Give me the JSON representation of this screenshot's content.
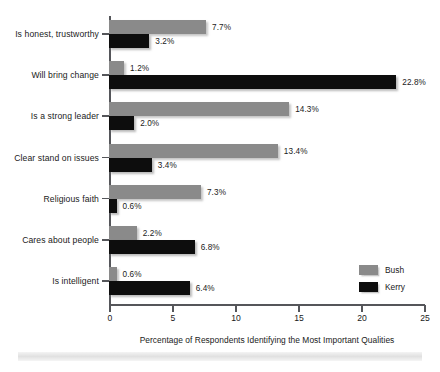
{
  "chart_data": {
    "type": "bar",
    "orientation": "horizontal",
    "title": "",
    "xlabel": "Percentage of Respondents Identifying the Most Important Qualities",
    "ylabel": "",
    "xlim": [
      0,
      25
    ],
    "xticks": [
      0,
      5,
      10,
      15,
      20,
      25
    ],
    "xtick_labels": [
      "0",
      "5",
      "10",
      "15",
      "20",
      "25"
    ],
    "grid": false,
    "legend_position": "right-bottom-inside",
    "categories": [
      "Is honest, trustworthy",
      "Will bring change",
      "Is a strong leader",
      "Clear stand on issues",
      "Religious faith",
      "Cares about people",
      "Is intelligent"
    ],
    "series": [
      {
        "name": "Bush",
        "color": "#8a8a8a",
        "values": [
          7.7,
          1.2,
          14.3,
          13.4,
          7.3,
          2.2,
          0.6
        ],
        "value_labels": [
          "7.7%",
          "1.2%",
          "14.3%",
          "13.4%",
          "7.3%",
          "2.2%",
          "0.6%"
        ]
      },
      {
        "name": "Kerry",
        "color": "#0d0d0d",
        "values": [
          3.2,
          22.8,
          2.0,
          3.4,
          0.6,
          6.8,
          6.4
        ],
        "value_labels": [
          "3.2%",
          "22.8%",
          "2.0%",
          "3.4%",
          "0.6%",
          "6.8%",
          "6.4%"
        ]
      }
    ]
  },
  "legend": {
    "items": [
      {
        "label": "Bush",
        "color": "#8a8a8a"
      },
      {
        "label": "Kerry",
        "color": "#0d0d0d"
      }
    ]
  },
  "axis": {
    "x_title": "Percentage of Respondents Identifying the Most Important Qualities"
  }
}
